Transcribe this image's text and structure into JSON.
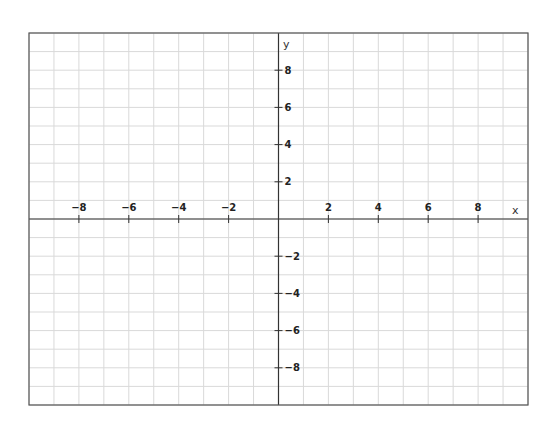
{
  "chart_data": {
    "type": "line",
    "title": "",
    "xlabel": "x",
    "ylabel": "y",
    "xlim": [
      -10,
      10
    ],
    "ylim": [
      -10,
      10
    ],
    "grid": true,
    "grid_step": 1,
    "x_ticks": [
      -8,
      -6,
      -4,
      -2,
      2,
      4,
      6,
      8
    ],
    "y_ticks": [
      -8,
      -6,
      -4,
      -2,
      2,
      4,
      6,
      8
    ],
    "x_tick_labels": [
      "−8",
      "−6",
      "−4",
      "−2",
      "2",
      "4",
      "6",
      "8"
    ],
    "y_tick_labels": [
      "−8",
      "−6",
      "−4",
      "−2",
      "2",
      "4",
      "6",
      "8"
    ],
    "series": [],
    "legend": null
  },
  "colors": {
    "grid": "#d9d9d9",
    "axis": "#333333",
    "border": "#555555",
    "background": "#ffffff"
  }
}
